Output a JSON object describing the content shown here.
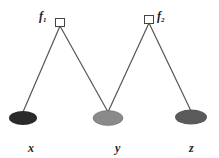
{
  "diagram": {
    "type": "factor-graph",
    "factors": [
      {
        "id": "f1",
        "label": "f",
        "subscript": "1"
      },
      {
        "id": "f2",
        "label": "f",
        "subscript": "2"
      }
    ],
    "variables": [
      {
        "id": "x",
        "label": "x",
        "fill": "#2a2a2a"
      },
      {
        "id": "y",
        "label": "y",
        "fill": "#8a8a8a"
      },
      {
        "id": "z",
        "label": "z",
        "fill": "#5a5a5a"
      }
    ],
    "edges": [
      [
        "f1",
        "x"
      ],
      [
        "f1",
        "y"
      ],
      [
        "f2",
        "y"
      ],
      [
        "f2",
        "z"
      ]
    ]
  }
}
